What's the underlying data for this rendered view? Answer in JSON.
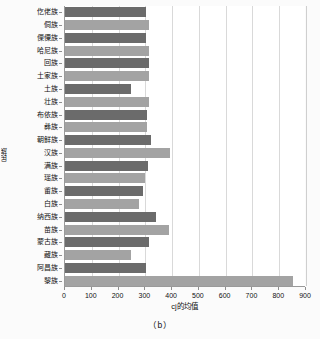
{
  "chart_data": {
    "type": "bar",
    "orientation": "horizontal",
    "title": "",
    "caption": "（b）",
    "xlabel": "cj的均值",
    "ylabel": "民族",
    "xlim": [
      0,
      900
    ],
    "xticks": [
      0,
      100,
      200,
      300,
      400,
      500,
      600,
      700,
      800,
      900
    ],
    "grid": true,
    "grid_axis": "x",
    "legend": "none",
    "colors": {
      "dark": "#6b6b6b",
      "light": "#a3a3a3",
      "axis": "#8f8f8f",
      "grid": "#d9d9d9",
      "background": "#ffffff"
    },
    "categories": [
      "仡佬族",
      "侗族",
      "傈僳族",
      "哈尼族",
      "回族",
      "土家族",
      "土族",
      "壮族",
      "布依族",
      "彝族",
      "朝鲜族",
      "汉族",
      "满族",
      "瑶族",
      "畲族",
      "白族",
      "纳西族",
      "苗族",
      "蒙古族",
      "藏族",
      "阿昌族",
      "黎族"
    ],
    "values": [
      302,
      313,
      302,
      314,
      312,
      314,
      245,
      313,
      308,
      306,
      320,
      391,
      310,
      297,
      293,
      277,
      338,
      388,
      315,
      245,
      303,
      852
    ],
    "bar_shades": [
      "dark",
      "light",
      "dark",
      "light",
      "dark",
      "light",
      "dark",
      "light",
      "dark",
      "light",
      "dark",
      "light",
      "dark",
      "light",
      "dark",
      "light",
      "dark",
      "light",
      "dark",
      "light",
      "dark",
      "light"
    ]
  }
}
